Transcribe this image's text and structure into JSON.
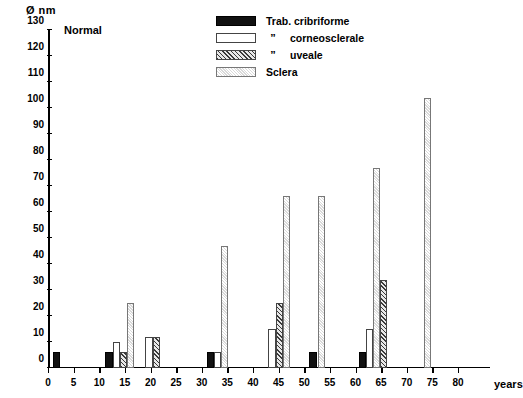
{
  "chart_data": {
    "type": "bar",
    "title": "Normal",
    "ylabel": "Ø nm",
    "xlabel": "years",
    "ylim": [
      0,
      130
    ],
    "xlim": [
      0,
      80
    ],
    "y_ticks": [
      0,
      10,
      20,
      30,
      40,
      50,
      60,
      70,
      80,
      90,
      100,
      110,
      120,
      130
    ],
    "x_ticks": [
      0,
      5,
      10,
      15,
      20,
      25,
      30,
      35,
      40,
      45,
      50,
      55,
      60,
      65,
      70,
      75,
      80
    ],
    "grid": false,
    "legend_position": "top-center",
    "series": [
      {
        "name": "Trab. cribriforme",
        "pattern": "solid-black"
      },
      {
        "name": "corneosclerale",
        "pattern": "white"
      },
      {
        "name": "uveale",
        "pattern": "hatched"
      },
      {
        "name": "Sclera",
        "pattern": "light-gray"
      }
    ],
    "bars": [
      {
        "series": "Trab. cribriforme",
        "x": 1.0,
        "value": 6
      },
      {
        "series": "Trab. cribriforme",
        "x": 11.2,
        "value": 6
      },
      {
        "series": "corneosclerale",
        "x": 12.6,
        "value": 10
      },
      {
        "series": "uveale",
        "x": 14.0,
        "value": 6
      },
      {
        "series": "Sclera",
        "x": 15.4,
        "value": 25
      },
      {
        "series": "corneosclerale",
        "x": 19.0,
        "value": 12
      },
      {
        "series": "uveale",
        "x": 20.4,
        "value": 12
      },
      {
        "series": "Trab. cribriforme",
        "x": 31.0,
        "value": 6
      },
      {
        "series": "corneosclerale",
        "x": 32.4,
        "value": 6
      },
      {
        "series": "Sclera",
        "x": 33.8,
        "value": 47
      },
      {
        "series": "corneosclerale",
        "x": 43.0,
        "value": 15
      },
      {
        "series": "uveale",
        "x": 44.4,
        "value": 25
      },
      {
        "series": "Sclera",
        "x": 45.8,
        "value": 66
      },
      {
        "series": "Trab. cribriforme",
        "x": 51.0,
        "value": 6
      },
      {
        "series": "Sclera",
        "x": 52.6,
        "value": 66
      },
      {
        "series": "Trab. cribriforme",
        "x": 60.6,
        "value": 6
      },
      {
        "series": "corneosclerale",
        "x": 62.0,
        "value": 15
      },
      {
        "series": "Sclera",
        "x": 63.4,
        "value": 77
      },
      {
        "series": "uveale",
        "x": 64.8,
        "value": 34
      },
      {
        "series": "Sclera",
        "x": 73.4,
        "value": 104
      }
    ]
  },
  "legend": {
    "rows": [
      {
        "label": "Trab. cribriforme",
        "quote": "",
        "swatch": "solid-black"
      },
      {
        "label": "corneosclerale",
        "quote": "”",
        "swatch": "white"
      },
      {
        "label": "uveale",
        "quote": "”",
        "swatch": "hatched"
      },
      {
        "label": "Sclera",
        "quote": "",
        "swatch": "light-gray"
      }
    ]
  },
  "colors": {
    "trab_cribriforme": "#111111",
    "corneosclerale": "#ffffff",
    "uveale": "#3a3a3a",
    "sclera": "#d9d9d9",
    "axis": "#000000",
    "background": "#ffffff"
  }
}
